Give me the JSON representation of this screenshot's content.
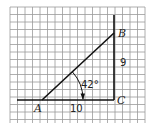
{
  "figure": {
    "type": "right-triangle-on-grid",
    "vertices": {
      "A": "A",
      "B": "B",
      "C": "C"
    },
    "angle_label": "42°",
    "side_labels": {
      "AC": "10",
      "BC": "9"
    },
    "colors": {
      "grid": "#9a9a9a",
      "lines": "#111111",
      "background": "#ffffff"
    }
  }
}
